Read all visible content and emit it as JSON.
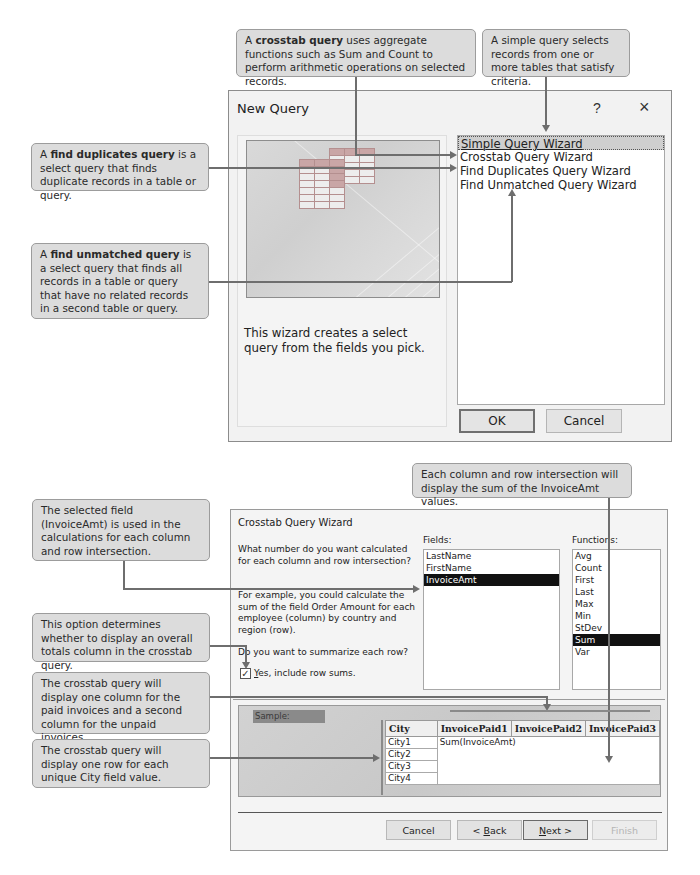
{
  "callouts": {
    "crosstab": {
      "pre": "A ",
      "bold": "crosstab query",
      "post": " uses aggregate functions such as Sum and Count to perform arithmetic operations on selected records."
    },
    "simple": {
      "text": "A simple query selects records from one or more tables that satisfy criteria."
    },
    "find_duplicates": {
      "pre": "A ",
      "bold": "find duplicates query",
      "post": " is a select query that finds duplicate records in a table or query."
    },
    "find_unmatched": {
      "pre": "A ",
      "bold": "find unmatched query",
      "post": " is a select query that finds all records in a table or query that have no related records in a second table or query."
    },
    "intersection_sum": {
      "text": "Each column and row intersection will display the sum of the InvoiceAmt values."
    },
    "selected_field": {
      "text": "The selected field (InvoiceAmt) is used in the calculations for each column and row intersection."
    },
    "row_totals": {
      "text": "This option determines whether to display an overall totals column in the crosstab query."
    },
    "columns": {
      "text": "The crosstab query will display one column for the paid invoices and a second column for the unpaid invoices."
    },
    "rows": {
      "text": "The crosstab query will display one row for each unique City field value."
    }
  },
  "new_query_dialog": {
    "title": "New Query",
    "help_icon": "?",
    "close_icon": "×",
    "description": "This wizard creates a select query from the fields you pick.",
    "wizards": [
      {
        "label": "Simple Query Wizard",
        "selected": true
      },
      {
        "label": "Crosstab Query Wizard",
        "selected": false
      },
      {
        "label": "Find Duplicates Query Wizard",
        "selected": false
      },
      {
        "label": "Find Unmatched Query Wizard",
        "selected": false
      }
    ],
    "ok_label": "OK",
    "cancel_label": "Cancel"
  },
  "crosstab_wizard": {
    "title": "Crosstab Query Wizard",
    "question": "What number do you want calculated for each column and row intersection?",
    "example": "For example, you could calculate the sum of the field Order Amount for each employee (column)  by country and region (row).",
    "summarize_question": "Do you want to summarize each row?",
    "checkbox": {
      "label_accel": "Y",
      "label_rest": "es, include row sums.",
      "checked": true,
      "check_glyph": "✓"
    },
    "fields_label": "Fields:",
    "fields": [
      {
        "label": "LastName",
        "selected": false
      },
      {
        "label": "FirstName",
        "selected": false
      },
      {
        "label": "InvoiceAmt",
        "selected": true
      }
    ],
    "functions_label": "Functions:",
    "functions": [
      {
        "label": "Avg",
        "selected": false
      },
      {
        "label": "Count",
        "selected": false
      },
      {
        "label": "First",
        "selected": false
      },
      {
        "label": "Last",
        "selected": false
      },
      {
        "label": "Max",
        "selected": false
      },
      {
        "label": "Min",
        "selected": false
      },
      {
        "label": "StDev",
        "selected": false
      },
      {
        "label": "Sum",
        "selected": true
      },
      {
        "label": "Var",
        "selected": false
      }
    ],
    "sample": {
      "label": "Sample:",
      "row_header": "City",
      "column_headers": [
        "InvoicePaid1",
        "InvoicePaid2",
        "InvoicePaid3"
      ],
      "rows": [
        "City1",
        "City2",
        "City3",
        "City4"
      ],
      "cell_value": "Sum(InvoiceAmt)"
    },
    "buttons": {
      "cancel": "Cancel",
      "back_accel": "B",
      "back_pre": "< ",
      "back_rest": "ack",
      "next_accel": "N",
      "next_rest": "ext >",
      "finish": "Finish"
    }
  }
}
